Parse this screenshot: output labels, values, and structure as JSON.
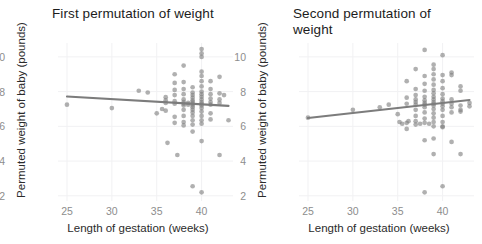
{
  "figure": {
    "axis_labels": {
      "x": "Length of gestation (weeks)",
      "y": "Permuted weight of baby (pounds)"
    },
    "colors": {
      "point": "#808080",
      "trend_line": "#7c7c7c",
      "grid": "#f1f1f3",
      "tick_text": "#8d8d8d",
      "panel_background": "#ffffff"
    }
  },
  "chart_data": [
    {
      "type": "scatter",
      "title": "First permutation of weight",
      "xlabel": "Length of gestation (weeks)",
      "ylabel": "Permuted weight of baby (pounds)",
      "xlim": [
        24.0,
        43.5
      ],
      "ylim": [
        1.7,
        10.8
      ],
      "xticks": [
        25,
        30,
        35,
        40
      ],
      "yticks": [
        2,
        4,
        6,
        8,
        10
      ],
      "grid": true,
      "legend": "none",
      "trend_line": {
        "type": "linear-fit",
        "x": [
          25.0,
          43.0
        ],
        "y": [
          7.72,
          7.18
        ],
        "slope": -0.03,
        "intercept": 8.47
      },
      "points": [
        [
          25.0,
          7.25
        ],
        [
          30.0,
          7.05
        ],
        [
          33.0,
          8.05
        ],
        [
          34.0,
          7.95
        ],
        [
          35.0,
          6.75
        ],
        [
          35.6,
          7.0
        ],
        [
          36.0,
          7.5
        ],
        [
          36.0,
          7.68
        ],
        [
          36.0,
          7.35
        ],
        [
          36.0,
          6.9
        ],
        [
          36.2,
          5.05
        ],
        [
          37.0,
          9.0
        ],
        [
          37.0,
          8.5
        ],
        [
          37.0,
          8.1
        ],
        [
          37.0,
          7.8
        ],
        [
          37.0,
          7.45
        ],
        [
          37.0,
          7.3
        ],
        [
          37.0,
          6.55
        ],
        [
          37.0,
          6.2
        ],
        [
          37.3,
          4.35
        ],
        [
          38.0,
          9.5
        ],
        [
          38.0,
          8.55
        ],
        [
          38.0,
          8.15
        ],
        [
          38.0,
          7.85
        ],
        [
          38.0,
          7.55
        ],
        [
          38.0,
          7.4
        ],
        [
          38.0,
          7.3
        ],
        [
          38.0,
          7.2
        ],
        [
          38.0,
          6.95
        ],
        [
          38.0,
          6.6
        ],
        [
          38.0,
          6.25
        ],
        [
          38.0,
          6.05
        ],
        [
          38.5,
          7.35
        ],
        [
          38.5,
          7.25
        ],
        [
          39.0,
          8.25
        ],
        [
          39.0,
          7.95
        ],
        [
          39.0,
          7.8
        ],
        [
          39.0,
          7.65
        ],
        [
          39.0,
          7.5
        ],
        [
          39.0,
          7.4
        ],
        [
          39.0,
          7.3
        ],
        [
          39.0,
          7.2
        ],
        [
          39.0,
          7.1
        ],
        [
          39.0,
          6.95
        ],
        [
          39.0,
          6.8
        ],
        [
          39.0,
          6.6
        ],
        [
          39.0,
          6.35
        ],
        [
          39.0,
          6.1
        ],
        [
          39.0,
          5.7
        ],
        [
          39.0,
          2.55
        ],
        [
          40.0,
          10.45
        ],
        [
          40.0,
          10.2
        ],
        [
          40.0,
          10.0
        ],
        [
          40.0,
          9.15
        ],
        [
          40.0,
          8.9
        ],
        [
          40.0,
          8.6
        ],
        [
          40.0,
          8.3
        ],
        [
          40.0,
          8.0
        ],
        [
          40.0,
          7.85
        ],
        [
          40.0,
          7.7
        ],
        [
          40.0,
          7.55
        ],
        [
          40.0,
          7.4
        ],
        [
          40.0,
          7.3
        ],
        [
          40.0,
          7.2
        ],
        [
          40.0,
          7.05
        ],
        [
          40.0,
          6.85
        ],
        [
          40.0,
          6.6
        ],
        [
          40.0,
          6.35
        ],
        [
          40.0,
          6.15
        ],
        [
          40.0,
          5.15
        ],
        [
          40.0,
          2.2
        ],
        [
          41.0,
          8.6
        ],
        [
          41.0,
          8.15
        ],
        [
          41.0,
          7.85
        ],
        [
          41.0,
          7.6
        ],
        [
          41.0,
          7.4
        ],
        [
          41.0,
          7.25
        ],
        [
          41.0,
          6.75
        ],
        [
          41.0,
          6.4
        ],
        [
          42.0,
          8.85
        ],
        [
          42.0,
          7.9
        ],
        [
          42.0,
          7.55
        ],
        [
          42.0,
          7.35
        ],
        [
          42.0,
          4.35
        ],
        [
          42.5,
          7.8
        ],
        [
          43.0,
          6.35
        ]
      ]
    },
    {
      "type": "scatter",
      "title": "Second permutation of weight",
      "xlabel": "Length of gestation (weeks)",
      "ylabel": "Permuted weight of baby (pounds)",
      "xlim": [
        24.0,
        43.5
      ],
      "ylim": [
        1.7,
        10.8
      ],
      "xticks": [
        25,
        30,
        35,
        40
      ],
      "yticks": [
        2,
        4,
        6,
        8,
        10
      ],
      "grid": true,
      "legend": "none",
      "trend_line": {
        "type": "linear-fit",
        "x": [
          25.0,
          43.0
        ],
        "y": [
          6.48,
          7.52
        ],
        "slope": 0.058,
        "intercept": 5.03
      },
      "points": [
        [
          25.0,
          6.5
        ],
        [
          30.0,
          6.95
        ],
        [
          33.0,
          7.1
        ],
        [
          34.0,
          7.25
        ],
        [
          35.0,
          6.7
        ],
        [
          35.2,
          6.25
        ],
        [
          35.5,
          6.15
        ],
        [
          36.0,
          8.6
        ],
        [
          36.0,
          7.65
        ],
        [
          36.0,
          7.3
        ],
        [
          36.0,
          6.2
        ],
        [
          36.0,
          5.85
        ],
        [
          36.2,
          6.3
        ],
        [
          37.0,
          9.3
        ],
        [
          37.0,
          8.15
        ],
        [
          37.0,
          7.8
        ],
        [
          37.0,
          7.55
        ],
        [
          37.0,
          7.4
        ],
        [
          37.0,
          7.25
        ],
        [
          37.0,
          6.95
        ],
        [
          37.0,
          6.6
        ],
        [
          37.0,
          6.3
        ],
        [
          37.0,
          6.1
        ],
        [
          37.5,
          6.15
        ],
        [
          38.0,
          10.4
        ],
        [
          38.0,
          8.9
        ],
        [
          38.0,
          8.45
        ],
        [
          38.0,
          8.05
        ],
        [
          38.0,
          7.7
        ],
        [
          38.0,
          7.5
        ],
        [
          38.0,
          7.35
        ],
        [
          38.0,
          7.25
        ],
        [
          38.0,
          7.1
        ],
        [
          38.0,
          6.8
        ],
        [
          38.0,
          6.45
        ],
        [
          38.0,
          6.2
        ],
        [
          38.0,
          5.2
        ],
        [
          38.0,
          2.2
        ],
        [
          38.5,
          6.15
        ],
        [
          39.0,
          9.55
        ],
        [
          39.0,
          9.3
        ],
        [
          39.0,
          9.0
        ],
        [
          39.0,
          8.7
        ],
        [
          39.0,
          8.4
        ],
        [
          39.0,
          8.1
        ],
        [
          39.0,
          7.9
        ],
        [
          39.0,
          7.7
        ],
        [
          39.0,
          7.55
        ],
        [
          39.0,
          7.4
        ],
        [
          39.0,
          7.3
        ],
        [
          39.0,
          7.2
        ],
        [
          39.0,
          7.0
        ],
        [
          39.0,
          6.75
        ],
        [
          39.0,
          6.5
        ],
        [
          39.0,
          6.25
        ],
        [
          39.0,
          6.0
        ],
        [
          39.0,
          5.3
        ],
        [
          39.0,
          4.4
        ],
        [
          40.0,
          10.1
        ],
        [
          40.0,
          8.95
        ],
        [
          40.0,
          8.6
        ],
        [
          40.0,
          8.2
        ],
        [
          40.0,
          7.85
        ],
        [
          40.0,
          7.6
        ],
        [
          40.0,
          7.45
        ],
        [
          40.0,
          7.3
        ],
        [
          40.0,
          7.15
        ],
        [
          40.0,
          6.95
        ],
        [
          40.0,
          6.6
        ],
        [
          40.0,
          6.25
        ],
        [
          40.0,
          6.0
        ],
        [
          40.0,
          5.95
        ],
        [
          40.0,
          2.55
        ],
        [
          41.0,
          9.1
        ],
        [
          41.0,
          8.95
        ],
        [
          41.0,
          7.55
        ],
        [
          41.0,
          7.3
        ],
        [
          41.0,
          7.1
        ],
        [
          41.0,
          6.8
        ],
        [
          41.0,
          5.1
        ],
        [
          42.0,
          8.3
        ],
        [
          42.0,
          8.05
        ],
        [
          42.0,
          7.2
        ],
        [
          42.0,
          6.95
        ],
        [
          42.0,
          6.85
        ],
        [
          42.0,
          4.4
        ],
        [
          43.0,
          7.35
        ],
        [
          43.0,
          7.15
        ]
      ]
    }
  ]
}
